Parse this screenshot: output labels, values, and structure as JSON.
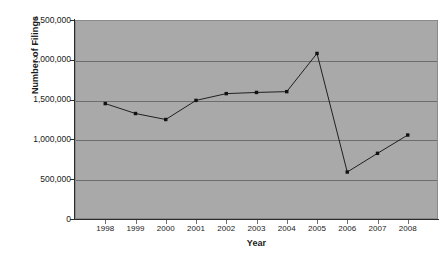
{
  "chart_data": {
    "type": "line",
    "title": "",
    "xlabel": "Year",
    "ylabel": "Number of Filings",
    "categories": [
      "1998",
      "1999",
      "2000",
      "2001",
      "2002",
      "2003",
      "2004",
      "2005",
      "2006",
      "2007",
      "2008"
    ],
    "values": [
      1450000,
      1325000,
      1250000,
      1490000,
      1575000,
      1590000,
      1600000,
      2080000,
      590000,
      825000,
      1055000
    ],
    "series": [
      {
        "name": "Number of Filings",
        "values": [
          1450000,
          1325000,
          1250000,
          1490000,
          1575000,
          1590000,
          1600000,
          2080000,
          590000,
          825000,
          1055000
        ]
      }
    ],
    "ylim": [
      0,
      2500000
    ],
    "ytick_values": [
      0,
      500000,
      1000000,
      1500000,
      2000000,
      2500000
    ],
    "ytick_labels": [
      "0",
      "500,000",
      "1,000,000",
      "1,500,000",
      "2,000,000",
      "2,500,000"
    ],
    "xtick_labels": [
      "1998",
      "1999",
      "2000",
      "2001",
      "2002",
      "2003",
      "2004",
      "2005",
      "2006",
      "2007",
      "2008"
    ],
    "grid": true,
    "legend": "none",
    "marker": "square",
    "colors": {
      "plot_background": "#a9a9a9",
      "gridline": "#6d6d6d",
      "axis": "#2b2b2b",
      "series": "#111111",
      "text": "#1a1a1a",
      "page_background": "#ffffff"
    }
  }
}
